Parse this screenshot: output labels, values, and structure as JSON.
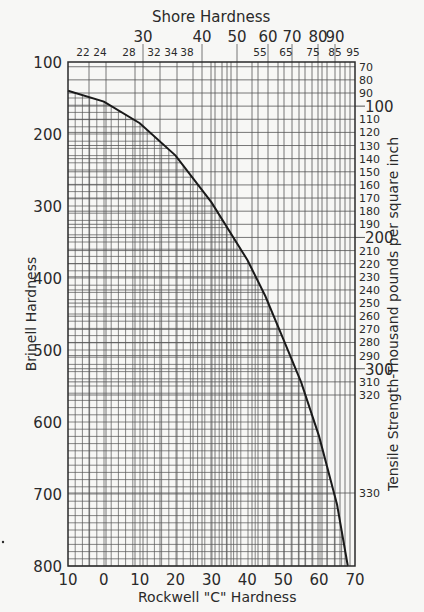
{
  "chart_data": {
    "type": "line",
    "xlabel": "Rockwell \"C\" Hardness",
    "ylabel": "Brinell Hardness",
    "top_axis_label": "Shore Hardness",
    "right_axis_label": "Tensile Strength-Thousand pounds per square inch",
    "xlim": [
      -10,
      70
    ],
    "ylim": [
      800,
      100
    ],
    "y_inverted": true,
    "grid": true,
    "x_tick_labels": [
      "10",
      "0",
      "10",
      "20",
      "30",
      "40",
      "50",
      "60",
      "70"
    ],
    "x_ticks": [
      -10,
      0,
      10,
      20,
      30,
      40,
      50,
      60,
      70
    ],
    "y_ticks": [
      100,
      200,
      300,
      400,
      500,
      600,
      700,
      800
    ],
    "y_tick_labels": [
      "100",
      "200",
      "300",
      "400",
      "500",
      "600",
      "700",
      "800"
    ],
    "shore_major_ticks": [
      "30",
      "40",
      "50",
      "60",
      "70",
      "80",
      "90"
    ],
    "shore_minor_ticks": [
      "22",
      "24",
      "28",
      "32",
      "34",
      "38",
      "55",
      "65",
      "75",
      "85",
      "95"
    ],
    "tensile_ticks": [
      "70",
      "80",
      "90",
      "100",
      "110",
      "120",
      "130",
      "140",
      "150",
      "160",
      "170",
      "180",
      "190",
      "200",
      "210",
      "220",
      "230",
      "240",
      "250",
      "260",
      "270",
      "280",
      "290",
      "300",
      "310",
      "320",
      "330"
    ],
    "tensile_major_ticks": [
      "100",
      "200",
      "300"
    ],
    "series": [
      {
        "name": "Rockwell C vs Brinell",
        "x": [
          -10,
          0,
          10,
          20,
          30,
          40,
          45,
          50,
          55,
          60,
          65,
          68
        ],
        "y": [
          140,
          155,
          185,
          230,
          295,
          375,
          425,
          485,
          545,
          620,
          715,
          800
        ]
      }
    ]
  },
  "labels": {
    "shore_title": "Shore Hardness",
    "x_title": "Rockwell \"C\" Hardness",
    "y_title": "Brinell Hardness",
    "y2_title": "Tensile Strength-Thousand pounds per square inch"
  },
  "colors": {
    "background": "#f7f7f5",
    "ink": "#2a2a2a",
    "grid": "#555555"
  }
}
